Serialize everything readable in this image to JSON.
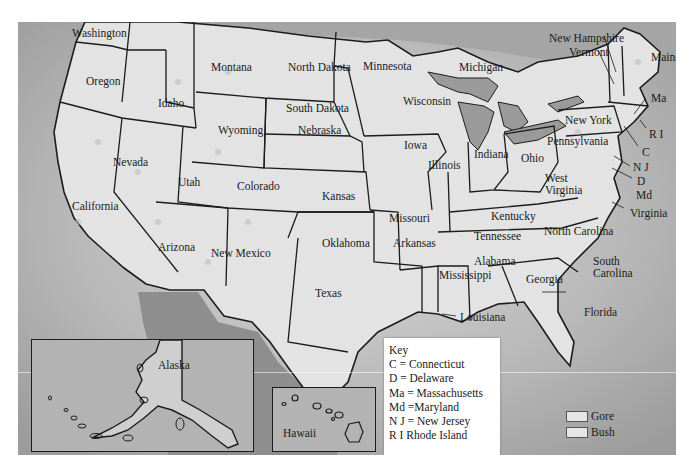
{
  "map": {
    "colors": {
      "ocean": "#a9a9a9",
      "land": "#e2e2e2",
      "mexico": "#8e8e8e",
      "border": "#1c1c1c",
      "lakes": "#9a9a9a"
    },
    "states": [
      {
        "name": "Washington",
        "x": 54,
        "y": 6
      },
      {
        "name": "Oregon",
        "x": 68,
        "y": 54
      },
      {
        "name": "Idaho",
        "x": 140,
        "y": 76
      },
      {
        "name": "Montana",
        "x": 193,
        "y": 40
      },
      {
        "name": "North Dakota",
        "x": 270,
        "y": 40
      },
      {
        "name": "Minnesota",
        "x": 345,
        "y": 39
      },
      {
        "name": "Michigan",
        "x": 441,
        "y": 40
      },
      {
        "name": "Wisconsin",
        "x": 385,
        "y": 74
      },
      {
        "name": "South Dakota",
        "x": 268,
        "y": 81
      },
      {
        "name": "Wyoming",
        "x": 200,
        "y": 103
      },
      {
        "name": "Iowa",
        "x": 386,
        "y": 118
      },
      {
        "name": "Nebraska",
        "x": 280,
        "y": 103
      },
      {
        "name": "Nevada",
        "x": 95,
        "y": 135
      },
      {
        "name": "Utah",
        "x": 160,
        "y": 155
      },
      {
        "name": "Colorado",
        "x": 219,
        "y": 159
      },
      {
        "name": "Kansas",
        "x": 304,
        "y": 169
      },
      {
        "name": "Illinois",
        "x": 410,
        "y": 138
      },
      {
        "name": "Indiana",
        "x": 456,
        "y": 127
      },
      {
        "name": "Ohio",
        "x": 503,
        "y": 131
      },
      {
        "name": "California",
        "x": 54,
        "y": 179
      },
      {
        "name": "Missouri",
        "x": 371,
        "y": 191
      },
      {
        "name": "Kentucky",
        "x": 473,
        "y": 189
      },
      {
        "name": "West",
        "x": 527,
        "y": 151
      },
      {
        "name": "Virginia",
        "x": 527,
        "y": 163
      },
      {
        "name": "Tennessee",
        "x": 456,
        "y": 209
      },
      {
        "name": "Arkansas",
        "x": 375,
        "y": 216
      },
      {
        "name": "Oklahoma",
        "x": 304,
        "y": 216
      },
      {
        "name": "Arizona",
        "x": 140,
        "y": 220
      },
      {
        "name": "New Mexico",
        "x": 193,
        "y": 226
      },
      {
        "name": "North Carolina",
        "x": 526,
        "y": 204
      },
      {
        "name": "Alabama",
        "x": 456,
        "y": 234
      },
      {
        "name": "Mississippi",
        "x": 421,
        "y": 248
      },
      {
        "name": "Georgia",
        "x": 508,
        "y": 252
      },
      {
        "name": "South",
        "x": 575,
        "y": 234
      },
      {
        "name": "Carolina",
        "x": 575,
        "y": 246
      },
      {
        "name": "Texas",
        "x": 297,
        "y": 266
      },
      {
        "name": "Louisiana",
        "x": 442,
        "y": 290
      },
      {
        "name": "Florida",
        "x": 566,
        "y": 285
      },
      {
        "name": "New York",
        "x": 547,
        "y": 93
      },
      {
        "name": "Pennsylvania",
        "x": 529,
        "y": 114
      },
      {
        "name": "New Hampshire",
        "x": 531,
        "y": 11
      },
      {
        "name": "Vermont",
        "x": 551,
        "y": 25
      },
      {
        "name": "Maine",
        "x": 633,
        "y": 30
      },
      {
        "name": "Ma",
        "x": 633,
        "y": 71
      },
      {
        "name": "R I",
        "x": 631,
        "y": 107
      },
      {
        "name": "C",
        "x": 624,
        "y": 125
      },
      {
        "name": "N J",
        "x": 615,
        "y": 140
      },
      {
        "name": "D",
        "x": 619,
        "y": 154
      },
      {
        "name": "Md",
        "x": 618,
        "y": 168
      },
      {
        "name": "Virginia",
        "x": 612,
        "y": 186
      }
    ]
  },
  "insets": {
    "alaska": {
      "label": "Alaska"
    },
    "hawaii": {
      "label": "Hawaii"
    }
  },
  "key": {
    "title": "Key",
    "items": [
      "C = Connecticut",
      "D = Delaware",
      "Ma = Massachusetts",
      "Md =Maryland",
      "N J = New Jersey",
      "R I Rhode Island"
    ]
  },
  "legend": {
    "items": [
      {
        "label": "Gore",
        "color": "#e6e6e6"
      },
      {
        "label": "Bush",
        "color": "#e6e6e6"
      }
    ]
  }
}
